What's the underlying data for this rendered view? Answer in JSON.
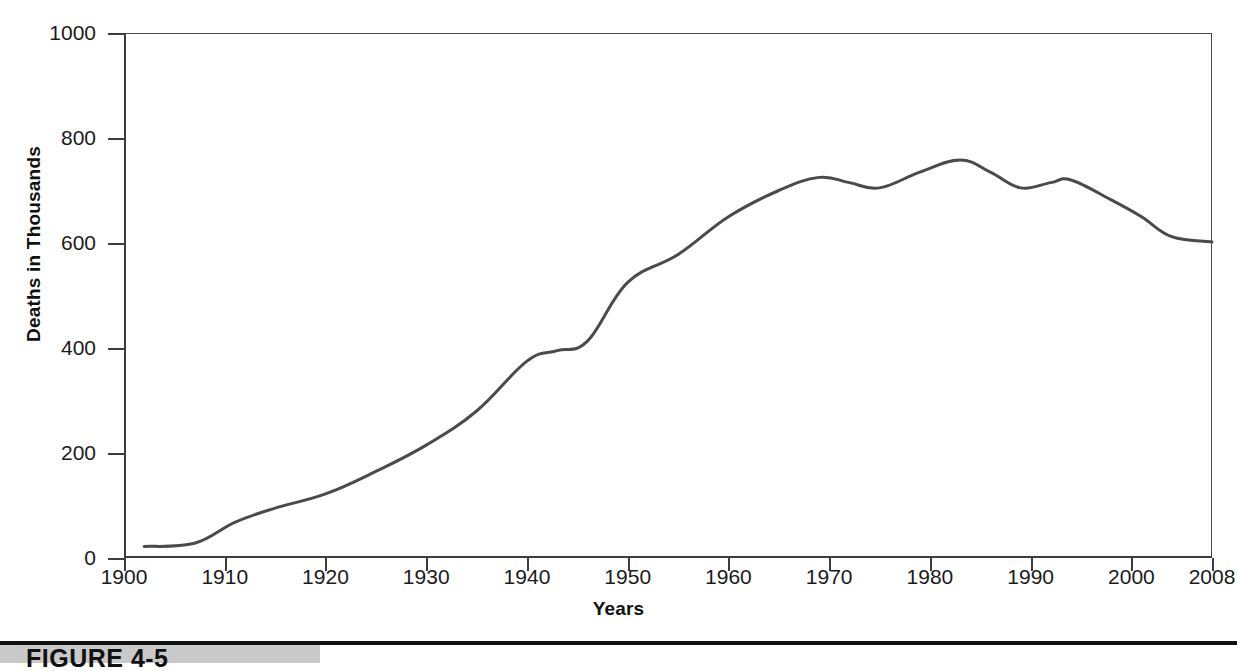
{
  "figure": {
    "caption_label": "FIGURE 4-5",
    "rule_color": "#111111",
    "band_color": "#c9c9c9"
  },
  "chart_data": {
    "type": "line",
    "title": "",
    "xlabel": "Years",
    "ylabel": "Deaths in Thousands",
    "xlim": [
      1900,
      2008
    ],
    "ylim": [
      0,
      1000
    ],
    "grid": false,
    "legend": "none",
    "line_color": "#4a4a4a",
    "axis_color": "#3d3d3d",
    "xticks": [
      1900,
      1910,
      1920,
      1930,
      1940,
      1950,
      1960,
      1970,
      1980,
      1990,
      2000,
      2008
    ],
    "xticklabels": [
      "1900",
      "1910",
      "1920",
      "1930",
      "1940",
      "1950",
      "1960",
      "1970",
      "1980",
      "1990",
      "2000",
      "2008"
    ],
    "yticks": [
      0,
      200,
      400,
      600,
      800,
      1000
    ],
    "yticklabels": [
      "0",
      "200",
      "400",
      "600",
      "800",
      "1000"
    ],
    "series": [
      {
        "name": "Deaths in Thousands",
        "x": [
          1902,
          1907,
          1911,
          1915,
          1920,
          1925,
          1930,
          1935,
          1940,
          1943,
          1946,
          1950,
          1955,
          1960,
          1965,
          1969,
          1972,
          1975,
          1979,
          1983,
          1986,
          1989,
          1992,
          1994,
          1998,
          2001,
          2004,
          2008
        ],
        "y": [
          22,
          28,
          68,
          95,
          122,
          165,
          215,
          280,
          375,
          395,
          413,
          525,
          578,
          650,
          700,
          725,
          715,
          705,
          735,
          758,
          735,
          705,
          715,
          720,
          682,
          650,
          612,
          602
        ]
      }
    ]
  }
}
